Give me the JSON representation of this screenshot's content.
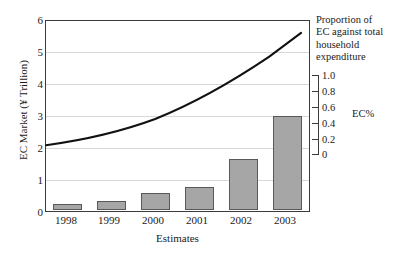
{
  "chart_data": {
    "type": "bar",
    "title": "",
    "xlabel": "Estimates",
    "ylabel": "EC Market (¥ Trillion)",
    "categories": [
      "1998",
      "1999",
      "2000",
      "2001",
      "2002",
      "2003"
    ],
    "ylim": [
      0,
      6
    ],
    "yticks": [
      "0",
      "1",
      "2",
      "3",
      "4",
      "5",
      "6"
    ],
    "grid": true,
    "legend_position": "none",
    "series": [
      {
        "name": "EC Market (¥ Trillion)",
        "render": "bar",
        "axis": "left",
        "values": [
          0.2,
          0.3,
          0.55,
          0.72,
          1.63,
          3.0
        ],
        "color": "#a6a6a6",
        "edge_color": "#595959"
      },
      {
        "name": "EC%",
        "render": "line",
        "axis": "right",
        "values": [
          0.16,
          0.2,
          0.26,
          0.34,
          0.47,
          0.7
        ],
        "color": "#111111"
      }
    ],
    "secondary_axis": {
      "label": "EC%",
      "ticks": [
        "1.0",
        "0.8",
        "0.6",
        "0.4",
        "0.2",
        "0"
      ],
      "range": [
        0,
        1.0
      ],
      "note": "Proportion of EC against total household expenditure"
    },
    "annotations": {
      "right_note_lines": [
        "Proportion of",
        "EC against total",
        "household",
        "expenditure"
      ]
    }
  },
  "axes": {
    "y_title": "EC Market (¥ Trillion)",
    "x_title": "Estimates",
    "y_tick_labels": [
      "6",
      "5",
      "4",
      "3",
      "2",
      "1",
      "0"
    ],
    "x_tick_labels": [
      "1998",
      "1999",
      "2000",
      "2001",
      "2002",
      "2003"
    ]
  },
  "secondary": {
    "title": "EC%",
    "tick_labels": [
      "1.0",
      "0.8",
      "0.6",
      "0.4",
      "0.2",
      "0"
    ]
  },
  "note": {
    "line1": "Proportion of",
    "line2": "EC against total",
    "line3": "household",
    "line4": "expenditure"
  },
  "colors": {
    "bar_fill": "#a6a6a6",
    "bar_edge": "#595959",
    "curve": "#111111",
    "grid": "#d8d8d8",
    "frame": "#3a3a3a"
  }
}
